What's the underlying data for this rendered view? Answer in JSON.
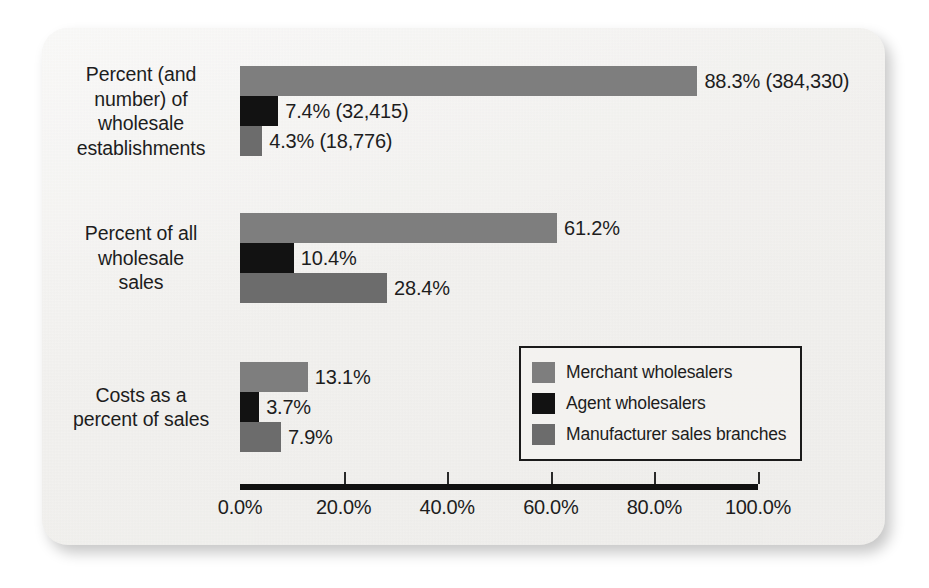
{
  "chart_data": {
    "type": "bar",
    "orientation": "horizontal",
    "title": "",
    "xlabel": "",
    "ylabel": "",
    "xlim": [
      0,
      100
    ],
    "xticks": [
      0,
      20,
      40,
      60,
      80,
      100
    ],
    "xtick_labels": [
      "0.0%",
      "20.0%",
      "40.0%",
      "60.0%",
      "80.0%",
      "100.0%"
    ],
    "grid": false,
    "legend_position": "inside-right-lower",
    "categories": [
      "Percent (and number) of wholesale establishments",
      "Percent of all wholesale sales",
      "Costs as a percent of sales"
    ],
    "category_label_lines": [
      [
        "Percent (and",
        "number) of",
        "wholesale",
        "establishments"
      ],
      [
        "Percent of all",
        "wholesale",
        "sales"
      ],
      [
        "Costs as a",
        "percent of sales"
      ]
    ],
    "series": [
      {
        "name": "Merchant wholesalers",
        "color": "#7e7e7e",
        "values": [
          88.3,
          61.2,
          13.1
        ],
        "data_labels": [
          "88.3% (384,330)",
          "61.2%",
          "13.1%"
        ]
      },
      {
        "name": "Agent wholesalers",
        "color": "#121212",
        "values": [
          7.4,
          10.4,
          3.7
        ],
        "data_labels": [
          "7.4% (32,415)",
          "10.4%",
          "3.7%"
        ]
      },
      {
        "name": "Manufacturer sales branches",
        "color": "#6c6c6c",
        "values": [
          4.3,
          28.4,
          7.9
        ],
        "data_labels": [
          "4.3% (18,776)",
          "28.4%",
          "7.9%"
        ]
      }
    ],
    "counts": {
      "merchant_wholesalers_establishments": "384,330",
      "agent_wholesalers_establishments": "32,415",
      "manufacturer_sales_branches_establishments": "18,776"
    }
  },
  "legend": {
    "items": [
      {
        "label": "Merchant wholesalers",
        "color": "#7e7e7e"
      },
      {
        "label": "Agent wholesalers",
        "color": "#121212"
      },
      {
        "label": "Manufacturer sales branches",
        "color": "#6c6c6c"
      }
    ]
  },
  "axis": {
    "tick_labels": [
      "0.0%",
      "20.0%",
      "40.0%",
      "60.0%",
      "80.0%",
      "100.0%"
    ]
  }
}
